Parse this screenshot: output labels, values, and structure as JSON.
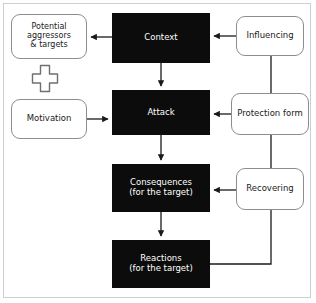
{
  "diagram": {
    "colors": {
      "black_node_fill": "#0c0c0c",
      "black_node_text": "#ffffff",
      "white_node_fill": "#ffffff",
      "white_node_border": "#8d8d8d",
      "white_node_text": "#1a1a1a",
      "connector": "#1a1a1a",
      "frame": "#cfcfcf",
      "background": "#ffffff"
    },
    "nodes": {
      "potential": {
        "label": "Potential\naggressors\n& targets",
        "style": "white"
      },
      "motivation": {
        "label": "Motivation",
        "style": "white"
      },
      "context": {
        "label": "Context",
        "style": "black"
      },
      "attack": {
        "label": "Attack",
        "style": "black"
      },
      "consequences": {
        "label": "Consequences\n(for the target)",
        "style": "black"
      },
      "reactions": {
        "label": "Reactions\n(for the target)",
        "style": "black"
      },
      "influencing": {
        "label": "Influencing",
        "style": "white"
      },
      "protection": {
        "label": "Protection form",
        "style": "white"
      },
      "recovering": {
        "label": "Recovering",
        "style": "white"
      }
    },
    "plus_symbol": {
      "name": "plus-symbol",
      "character": "+"
    },
    "connectors": [
      {
        "from": "context",
        "to": "potential",
        "direction": "left",
        "arrow": true
      },
      {
        "from": "influencing",
        "to": "context",
        "direction": "left",
        "arrow": true
      },
      {
        "from": "context",
        "to": "attack",
        "direction": "down",
        "arrow": true
      },
      {
        "from": "motivation",
        "to": "attack",
        "direction": "right",
        "arrow": true
      },
      {
        "from": "protection",
        "to": "attack",
        "direction": "left",
        "arrow": true
      },
      {
        "from": "attack",
        "to": "consequences",
        "direction": "down",
        "arrow": true
      },
      {
        "from": "recovering",
        "to": "consequences",
        "direction": "left",
        "arrow": true
      },
      {
        "from": "consequences",
        "to": "reactions",
        "direction": "down",
        "arrow": true
      },
      {
        "from": "influencing",
        "to": "protection",
        "direction": "down",
        "arrow": false
      },
      {
        "from": "protection",
        "to": "recovering",
        "direction": "down",
        "arrow": false
      },
      {
        "from": "reactions",
        "to": "recovering",
        "direction": "up-right",
        "arrow": false
      }
    ]
  }
}
